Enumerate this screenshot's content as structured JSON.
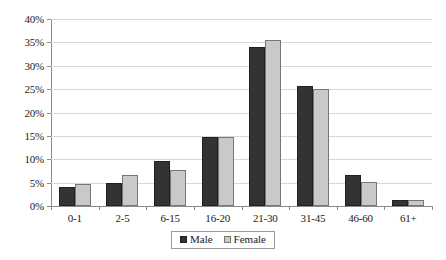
{
  "chart_data": {
    "type": "bar",
    "title": "",
    "subtitle": "",
    "xlabel": "",
    "ylabel": "",
    "categories": [
      "0-1",
      "2-5",
      "6-15",
      "16-20",
      "21-30",
      "31-45",
      "46-60",
      "61+"
    ],
    "series": [
      {
        "name": "Male",
        "color": "#333333",
        "values": [
          4.1,
          5.0,
          9.7,
          14.7,
          34.1,
          25.6,
          6.6,
          1.2
        ]
      },
      {
        "name": "Female",
        "color": "#c9c9c9",
        "values": [
          4.8,
          6.7,
          7.6,
          14.7,
          35.5,
          25.1,
          5.1,
          1.2
        ]
      }
    ],
    "ylim": [
      0,
      40
    ],
    "ytick_values": [
      0,
      5,
      10,
      15,
      20,
      25,
      30,
      35,
      40
    ],
    "ytick_labels": [
      "0%",
      "5%",
      "10%",
      "15%",
      "20%",
      "25%",
      "30%",
      "35%",
      "40%"
    ],
    "value_unit": "%",
    "grid": {
      "horizontal": true,
      "vertical": false,
      "color": "#d8d8d8"
    },
    "legend": {
      "position": "bottom",
      "entries": [
        "Male",
        "Female"
      ]
    },
    "axis_color": "#8a8a8a",
    "background": "#ffffff"
  }
}
